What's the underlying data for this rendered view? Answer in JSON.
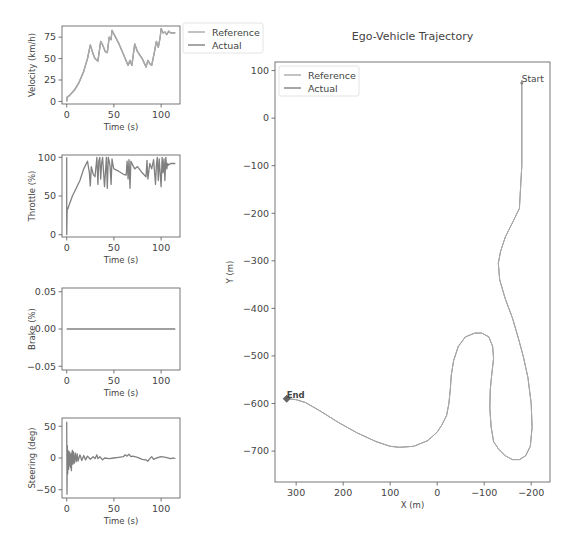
{
  "chart_data": [
    {
      "type": "line",
      "title": "",
      "xlabel": "Time (s)",
      "ylabel": "Velocity (km/h)",
      "xlim": [
        -5,
        120
      ],
      "ylim": [
        -3,
        88
      ],
      "xticks": [
        0,
        50,
        100
      ],
      "yticks": [
        0,
        25,
        50,
        75
      ],
      "legend": {
        "position": "outside-right",
        "entries": [
          "Reference",
          "Actual"
        ]
      },
      "series": [
        {
          "name": "Reference",
          "x": [
            0,
            0.5,
            3,
            8,
            13,
            18,
            22,
            25,
            28,
            30,
            33,
            36,
            38,
            41,
            43,
            45,
            47,
            48,
            55,
            60,
            65,
            67,
            69,
            72,
            75,
            80,
            84,
            86,
            88,
            90,
            93,
            95,
            97,
            99,
            100,
            102,
            104,
            106,
            108,
            110,
            115
          ],
          "y": [
            0,
            5,
            7,
            13,
            22,
            35,
            50,
            66,
            55,
            50,
            47,
            70,
            66,
            58,
            57,
            75,
            72,
            83,
            68,
            55,
            42,
            48,
            42,
            67,
            58,
            50,
            40,
            48,
            44,
            42,
            58,
            70,
            63,
            75,
            85,
            80,
            81,
            78,
            82,
            80,
            80
          ]
        },
        {
          "name": "Actual",
          "x": [
            0,
            0.5,
            3,
            8,
            13,
            18,
            22,
            25,
            28,
            30,
            33,
            36,
            38,
            41,
            43,
            45,
            47,
            48,
            55,
            60,
            65,
            67,
            69,
            72,
            75,
            80,
            84,
            86,
            88,
            90,
            93,
            95,
            97,
            99,
            100,
            102,
            104,
            106,
            108,
            110,
            115
          ],
          "y": [
            0,
            5,
            7,
            13,
            22,
            35,
            50,
            66,
            55,
            50,
            47,
            70,
            66,
            58,
            57,
            75,
            72,
            83,
            68,
            55,
            42,
            48,
            42,
            67,
            58,
            50,
            40,
            48,
            44,
            42,
            58,
            70,
            63,
            75,
            85,
            80,
            81,
            78,
            82,
            80,
            80
          ]
        }
      ]
    },
    {
      "type": "line",
      "xlabel": "Time (s)",
      "ylabel": "Throttle (%)",
      "xlim": [
        -5,
        120
      ],
      "ylim": [
        -3,
        103
      ],
      "xticks": [
        0,
        50,
        100
      ],
      "yticks": [
        0,
        50,
        100
      ],
      "series": [
        {
          "name": "Actual",
          "x": [
            0,
            0,
            0.5,
            1,
            3,
            6,
            10,
            14,
            18,
            22,
            24,
            25,
            26,
            28,
            30,
            32,
            33,
            34,
            35,
            36,
            37,
            38,
            40,
            42,
            43,
            44,
            45,
            46,
            47,
            48,
            49,
            50,
            55,
            60,
            63,
            64,
            65,
            66,
            67,
            68,
            70,
            72,
            75,
            80,
            84,
            85,
            86,
            88,
            90,
            92,
            94,
            95,
            96,
            97,
            98,
            100,
            101,
            102,
            103,
            104,
            105,
            106,
            107,
            108,
            110,
            115
          ],
          "y": [
            100,
            0,
            35,
            33,
            40,
            50,
            60,
            70,
            85,
            95,
            80,
            63,
            88,
            78,
            75,
            100,
            65,
            95,
            100,
            72,
            92,
            100,
            62,
            100,
            60,
            100,
            95,
            88,
            65,
            98,
            90,
            85,
            82,
            78,
            77,
            95,
            72,
            97,
            60,
            95,
            90,
            85,
            88,
            80,
            75,
            96,
            72,
            92,
            85,
            97,
            65,
            90,
            100,
            70,
            98,
            62,
            100,
            80,
            98,
            70,
            100,
            85,
            92,
            90,
            92,
            92
          ]
        }
      ]
    },
    {
      "type": "line",
      "xlabel": "Time (s)",
      "ylabel": "Brake (%)",
      "xlim": [
        -5,
        120
      ],
      "ylim": [
        -0.055,
        0.055
      ],
      "xticks": [
        0,
        50,
        100
      ],
      "yticks": [
        -0.05,
        0.0,
        0.05
      ],
      "ytick_labels": [
        "−0.05",
        "0.00",
        "0.05"
      ],
      "series": [
        {
          "name": "Actual",
          "x": [
            0,
            115
          ],
          "y": [
            0,
            0
          ]
        }
      ]
    },
    {
      "type": "line",
      "xlabel": "Time (s)",
      "ylabel": "Steering (deg)",
      "xlim": [
        -5,
        120
      ],
      "ylim": [
        -63,
        63
      ],
      "xticks": [
        0,
        50,
        100
      ],
      "yticks": [
        -50,
        0,
        50
      ],
      "ytick_labels": [
        "−50",
        "0",
        "50"
      ],
      "series": [
        {
          "name": "Actual",
          "x": [
            0,
            0.3,
            0.6,
            1,
            1.5,
            2,
            2.5,
            3,
            3.5,
            4,
            4.5,
            5,
            5.5,
            6,
            6.5,
            7,
            8,
            9,
            10,
            11,
            12,
            14,
            16,
            18,
            20,
            22,
            25,
            28,
            30,
            32,
            33,
            35,
            38,
            40,
            45,
            50,
            55,
            60,
            62,
            64,
            66,
            68,
            70,
            75,
            80,
            84,
            86,
            88,
            90,
            92,
            95,
            100,
            105,
            110,
            113,
            115
          ],
          "y": [
            57,
            -57,
            20,
            -25,
            12,
            -18,
            10,
            -12,
            8,
            -15,
            6,
            -20,
            8,
            12,
            -10,
            10,
            -8,
            8,
            -6,
            7,
            -5,
            5,
            -4,
            4,
            -3,
            3,
            -2,
            2,
            -1,
            5,
            -1,
            2,
            -3,
            0,
            -1,
            0,
            1,
            2,
            5,
            3,
            6,
            2,
            3,
            1,
            -2,
            -3,
            -5,
            -1,
            2,
            -2,
            0,
            2,
            1,
            -1,
            0,
            -1
          ]
        }
      ]
    },
    {
      "type": "line",
      "title": "Ego-Vehicle Trajectory",
      "xlabel": "X (m)",
      "ylabel": "Y (m)",
      "xlim": [
        345,
        -240
      ],
      "ylim": [
        -765,
        118
      ],
      "xticks": [
        300,
        200,
        100,
        0,
        -100,
        -200
      ],
      "xtick_labels": [
        "300",
        "200",
        "100",
        "0",
        "−100",
        "−200"
      ],
      "yticks": [
        100,
        0,
        -100,
        -200,
        -300,
        -400,
        -500,
        -600,
        -700
      ],
      "ytick_labels": [
        "100",
        "0",
        "−100",
        "−200",
        "−300",
        "−400",
        "−500",
        "−600",
        "−700"
      ],
      "legend": {
        "position": "upper left",
        "entries": [
          "Reference",
          "Actual"
        ]
      },
      "annotations": [
        {
          "text": "Start",
          "x": -180,
          "y": 80
        },
        {
          "text": "End",
          "x": 318,
          "y": -590
        }
      ],
      "series": [
        {
          "name": "Reference",
          "x": [
            -180,
            -180,
            -180,
            -175,
            -160,
            -145,
            -135,
            -130,
            -133,
            -145,
            -160,
            -172,
            -183,
            -193,
            -200,
            -202,
            -198,
            -188,
            -175,
            -160,
            -145,
            -130,
            -120,
            -115,
            -112,
            -113,
            -116,
            -120,
            -118,
            -110,
            -95,
            -80,
            -60,
            -45,
            -35,
            -30,
            -28,
            -25,
            -20,
            -10,
            0,
            20,
            50,
            80,
            100,
            130,
            170,
            210,
            250,
            280,
            300,
            315
          ],
          "y": [
            80,
            0,
            -100,
            -190,
            -220,
            -250,
            -280,
            -305,
            -340,
            -380,
            -420,
            -460,
            -500,
            -545,
            -600,
            -650,
            -690,
            -710,
            -718,
            -718,
            -710,
            -695,
            -680,
            -650,
            -610,
            -570,
            -540,
            -505,
            -480,
            -460,
            -452,
            -452,
            -460,
            -480,
            -510,
            -540,
            -570,
            -600,
            -625,
            -645,
            -660,
            -678,
            -690,
            -692,
            -690,
            -680,
            -662,
            -640,
            -615,
            -598,
            -592,
            -590
          ]
        },
        {
          "name": "Actual",
          "x": [
            -180,
            -180,
            -180,
            -175,
            -160,
            -145,
            -135,
            -130,
            -133,
            -145,
            -160,
            -172,
            -183,
            -193,
            -200,
            -202,
            -198,
            -188,
            -175,
            -160,
            -145,
            -130,
            -120,
            -115,
            -112,
            -113,
            -116,
            -120,
            -118,
            -110,
            -95,
            -80,
            -60,
            -45,
            -35,
            -30,
            -28,
            -25,
            -20,
            -10,
            0,
            20,
            50,
            80,
            100,
            130,
            170,
            210,
            250,
            280,
            300,
            315
          ],
          "y": [
            80,
            0,
            -100,
            -190,
            -220,
            -250,
            -280,
            -305,
            -340,
            -380,
            -420,
            -460,
            -500,
            -545,
            -600,
            -650,
            -690,
            -710,
            -718,
            -718,
            -710,
            -695,
            -680,
            -650,
            -610,
            -570,
            -540,
            -505,
            -480,
            -460,
            -452,
            -452,
            -460,
            -480,
            -510,
            -540,
            -570,
            -600,
            -625,
            -645,
            -660,
            -678,
            -690,
            -692,
            -690,
            -680,
            -662,
            -640,
            -615,
            -598,
            -592,
            -590
          ]
        }
      ]
    }
  ],
  "colors": {
    "reference": "#aaaaaa",
    "actual": "#808080",
    "axes": "#555555",
    "text": "#444444"
  },
  "labels": {
    "velocity_ylabel": "Velocity (km/h)",
    "throttle_ylabel": "Throttle (%)",
    "brake_ylabel": "Brake (%)",
    "steering_ylabel": "Steering (deg)",
    "time_xlabel": "Time (s)",
    "traj_title": "Ego-Vehicle Trajectory",
    "traj_xlabel": "X (m)",
    "traj_ylabel": "Y (m)",
    "legend_reference": "Reference",
    "legend_actual": "Actual",
    "start": "Start",
    "end": "End"
  }
}
